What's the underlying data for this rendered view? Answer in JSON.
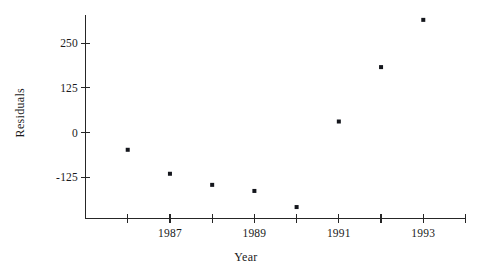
{
  "chart_data": {
    "type": "scatter",
    "title": "",
    "xlabel": "Year",
    "ylabel": "Residuals",
    "x": [
      1986,
      1987,
      1988,
      1989,
      1990,
      1991,
      1992,
      1993
    ],
    "values": [
      -48,
      -115,
      -146,
      -163,
      -208,
      31,
      183,
      315
    ],
    "series": [
      {
        "name": "Residuals",
        "points": [
          {
            "x": 1986,
            "y": -48
          },
          {
            "x": 1987,
            "y": -115
          },
          {
            "x": 1988,
            "y": -146
          },
          {
            "x": 1989,
            "y": -163
          },
          {
            "x": 1990,
            "y": -208
          },
          {
            "x": 1991,
            "y": 31
          },
          {
            "x": 1992,
            "y": 183
          },
          {
            "x": 1993,
            "y": 315
          }
        ],
        "marker": "square",
        "color": "#14161c"
      }
    ],
    "xlim": [
      1985.0,
      1994.0
    ],
    "ylim": [
      -240,
      330
    ],
    "xticks": [
      1986,
      1987,
      1988,
      1989,
      1990,
      1991,
      1992,
      1993,
      1994
    ],
    "xticklabels": [
      "",
      "1987",
      "",
      "1989",
      "",
      "1991",
      "",
      "1993",
      ""
    ],
    "yticks": [
      -125,
      0,
      125,
      250
    ],
    "yticklabels": [
      "-125",
      "0",
      "125",
      "250"
    ],
    "grid": false,
    "legend": false,
    "legend_position": "none",
    "axis_color": "#262626",
    "background": "#ffffff"
  }
}
